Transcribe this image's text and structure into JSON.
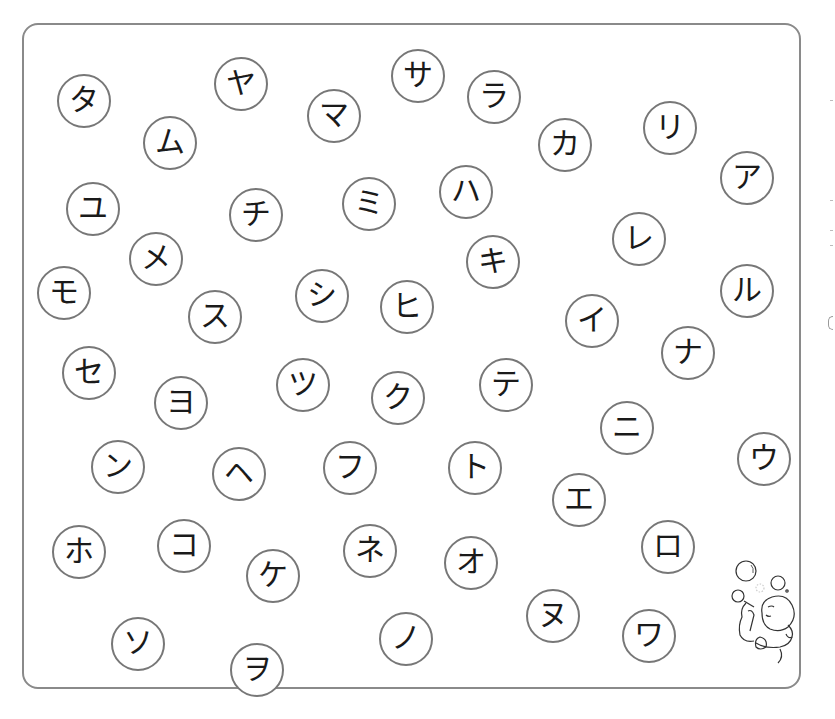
{
  "worksheet": {
    "type": "katakana-bubble-sheet",
    "border_color": "#8a8a8a",
    "circle_border_color": "#777777",
    "text_color": "#1a1a1a",
    "bubbles": [
      {
        "char": "タ",
        "x": 84,
        "y": 101
      },
      {
        "char": "ム",
        "x": 170,
        "y": 143
      },
      {
        "char": "ヤ",
        "x": 241,
        "y": 84
      },
      {
        "char": "マ",
        "x": 334,
        "y": 116
      },
      {
        "char": "サ",
        "x": 418,
        "y": 76
      },
      {
        "char": "ラ",
        "x": 494,
        "y": 97
      },
      {
        "char": "カ",
        "x": 565,
        "y": 145
      },
      {
        "char": "リ",
        "x": 670,
        "y": 128
      },
      {
        "char": "ア",
        "x": 747,
        "y": 178
      },
      {
        "char": "ユ",
        "x": 93,
        "y": 209
      },
      {
        "char": "チ",
        "x": 256,
        "y": 215
      },
      {
        "char": "ミ",
        "x": 369,
        "y": 204
      },
      {
        "char": "ハ",
        "x": 466,
        "y": 192
      },
      {
        "char": "メ",
        "x": 156,
        "y": 259
      },
      {
        "char": "キ",
        "x": 493,
        "y": 262
      },
      {
        "char": "レ",
        "x": 639,
        "y": 239
      },
      {
        "char": "モ",
        "x": 64,
        "y": 293
      },
      {
        "char": "ス",
        "x": 215,
        "y": 317
      },
      {
        "char": "シ",
        "x": 322,
        "y": 296
      },
      {
        "char": "ヒ",
        "x": 407,
        "y": 307
      },
      {
        "char": "イ",
        "x": 592,
        "y": 321
      },
      {
        "char": "ル",
        "x": 747,
        "y": 291
      },
      {
        "char": "ナ",
        "x": 688,
        "y": 353
      },
      {
        "char": "セ",
        "x": 89,
        "y": 373
      },
      {
        "char": "ヨ",
        "x": 181,
        "y": 403
      },
      {
        "char": "ツ",
        "x": 303,
        "y": 385
      },
      {
        "char": "ク",
        "x": 398,
        "y": 398
      },
      {
        "char": "テ",
        "x": 506,
        "y": 385
      },
      {
        "char": "ニ",
        "x": 627,
        "y": 428
      },
      {
        "char": "ウ",
        "x": 764,
        "y": 459
      },
      {
        "char": "ン",
        "x": 118,
        "y": 467
      },
      {
        "char": "ヘ",
        "x": 239,
        "y": 474
      },
      {
        "char": "フ",
        "x": 350,
        "y": 468
      },
      {
        "char": "ト",
        "x": 475,
        "y": 468
      },
      {
        "char": "エ",
        "x": 579,
        "y": 500
      },
      {
        "char": "ホ",
        "x": 79,
        "y": 552
      },
      {
        "char": "コ",
        "x": 184,
        "y": 546
      },
      {
        "char": "ケ",
        "x": 273,
        "y": 576
      },
      {
        "char": "ネ",
        "x": 370,
        "y": 551
      },
      {
        "char": "オ",
        "x": 471,
        "y": 563
      },
      {
        "char": "ロ",
        "x": 668,
        "y": 547
      },
      {
        "char": "ソ",
        "x": 138,
        "y": 644
      },
      {
        "char": "ヲ",
        "x": 257,
        "y": 670
      },
      {
        "char": "ノ",
        "x": 406,
        "y": 639
      },
      {
        "char": "ヌ",
        "x": 553,
        "y": 616
      },
      {
        "char": "ワ",
        "x": 649,
        "y": 636
      }
    ]
  },
  "illustration": {
    "subject": "child-blowing-bubbles"
  }
}
